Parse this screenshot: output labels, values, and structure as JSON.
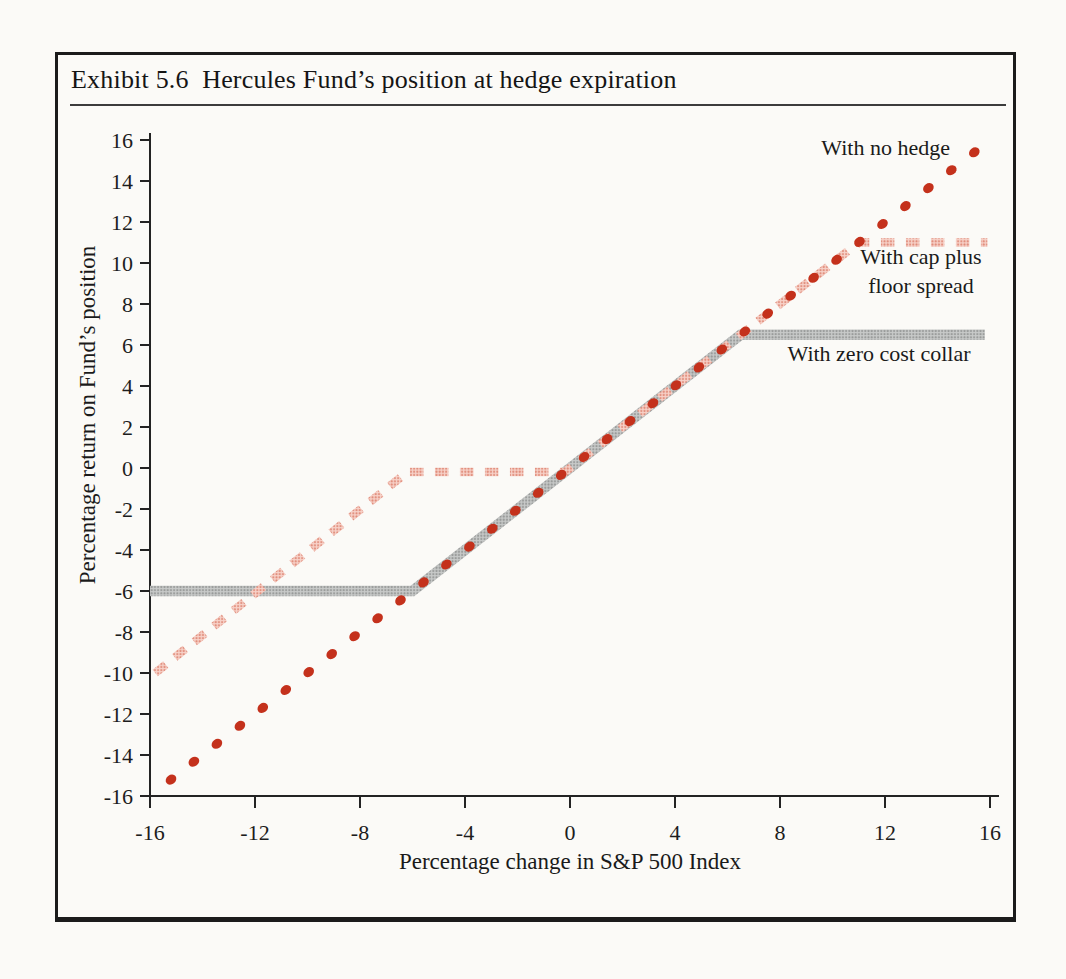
{
  "figure": {
    "title": "Exhibit 5.6  Hercules Fund’s position at hedge expiration",
    "border_color": "#1b1b1b",
    "paper_color": "#fbfaf7"
  },
  "chart_data": {
    "type": "line",
    "title": "Hercules Fund’s position at hedge expiration",
    "xlabel": "Percentage change in S&P 500 Index",
    "ylabel": "Percentage return on Fund’s position",
    "xlim": [
      -16,
      16
    ],
    "ylim": [
      -16,
      16
    ],
    "x_ticks": [
      -16,
      -12,
      -8,
      -4,
      0,
      4,
      8,
      12,
      16
    ],
    "y_ticks": [
      16,
      14,
      12,
      10,
      8,
      6,
      4,
      2,
      0,
      -2,
      -4,
      -6,
      -8,
      -10,
      -12,
      -14,
      -16
    ],
    "grid": false,
    "axis_color": "#232323",
    "legend_position": "inline-annotations",
    "series": [
      {
        "name": "With no hedge",
        "style": "dotted",
        "color": "#c4311c",
        "relation": "y = x (unhedged return equals index change)",
        "points": [
          [
            -15.2,
            -15.2
          ],
          [
            15.4,
            15.4
          ]
        ],
        "dot_spacing": 0.88
      },
      {
        "name": "With cap plus floor spread",
        "style": "dashed",
        "color": "#edab9e",
        "halftone": {
          "base": "#f7d2c9",
          "dot": "#e08b79"
        },
        "points": [
          [
            -15.8,
            -10
          ],
          [
            -6.2,
            -0.2
          ],
          [
            -0.2,
            -0.2
          ],
          [
            11,
            11
          ],
          [
            15.9,
            11
          ]
        ],
        "floor_spread": {
          "protected_range": [
            -6,
            0
          ],
          "cap_level": 11,
          "value_at_minus16": -10
        }
      },
      {
        "name": "With zero cost collar",
        "style": "thick-solid",
        "color": "#b9bbba",
        "halftone": {
          "base": "#c8cac9",
          "dot": "#969897"
        },
        "points": [
          [
            -16,
            -6
          ],
          [
            -6,
            -6
          ],
          [
            6.5,
            6.5
          ],
          [
            15.8,
            6.5
          ]
        ],
        "collar": {
          "floor_level": -6,
          "cap_level": 6.5
        }
      }
    ],
    "annotations": [
      {
        "text": "With no hedge",
        "x": 13.2,
        "y": 15.3
      },
      {
        "text": "With cap plus floor spread",
        "lines": [
          "With cap plus",
          "floor spread"
        ],
        "x": 13.2,
        "y": 9.2
      },
      {
        "text": "With zero cost collar",
        "x": 12,
        "y": 4.9
      }
    ]
  }
}
